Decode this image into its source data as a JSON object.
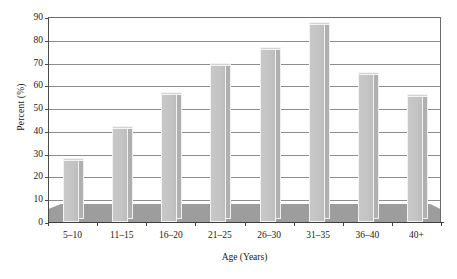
{
  "chart_data": {
    "type": "bar",
    "title": "",
    "subtitle": "",
    "xlabel": "Age (Years)",
    "ylabel": "Percent (%)",
    "categories": [
      "5–10",
      "11–15",
      "16–20",
      "21–25",
      "26–30",
      "31–35",
      "36–40",
      "40+"
    ],
    "values": [
      28,
      42,
      57,
      70,
      77,
      88,
      66,
      56
    ],
    "ylim": [
      0,
      90
    ],
    "ytick_labels": [
      "0",
      "10",
      "20",
      "30",
      "40",
      "50",
      "60",
      "70",
      "80",
      "90"
    ],
    "ytick_values": [
      0,
      10,
      20,
      30,
      40,
      50,
      60,
      70,
      80,
      90
    ],
    "grid": true,
    "legend": false,
    "legend_position": "none",
    "series": [
      {
        "name": "Percent",
        "values": [
          28,
          42,
          57,
          70,
          77,
          88,
          66,
          56
        ]
      }
    ],
    "colors": {
      "bar_fill": "#c4c4c4",
      "bar_side": "#b0b0b0",
      "bar_top": "#d4d4d4",
      "bar_outline": "#f2f2f2",
      "gridline": "#8d8d8d",
      "axis": "#3d3d3d",
      "floor": "#9d9d9d",
      "text": "#1a1a1a",
      "background": "#ffffff"
    }
  }
}
